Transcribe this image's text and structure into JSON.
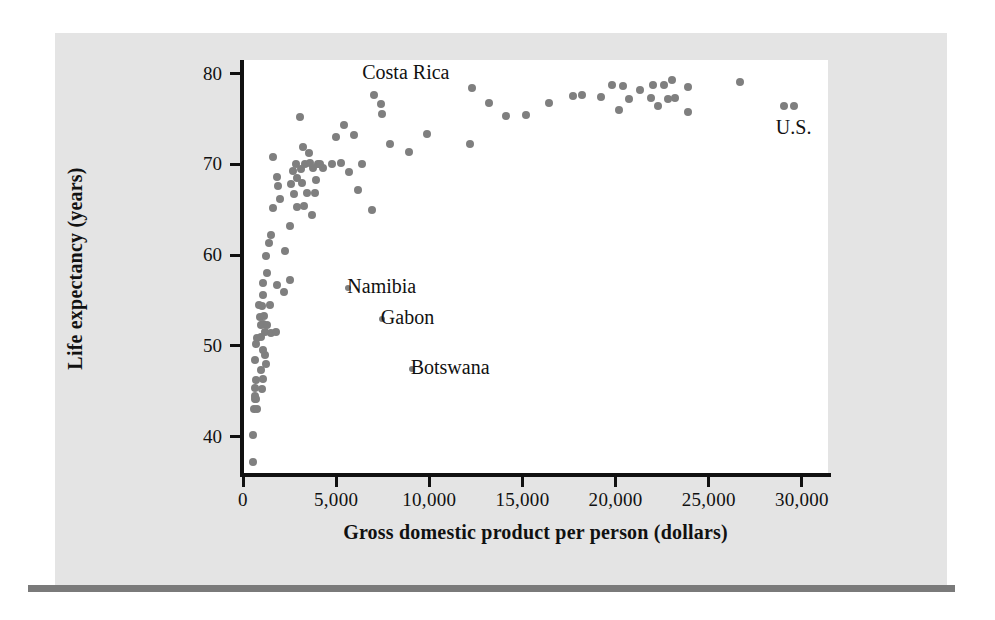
{
  "figure": {
    "background_color": "#e4e4e4",
    "plot_background_color": "#ffffff",
    "rule_color": "#7a7a7a",
    "point_color": "#7f7f7f",
    "axis_color": "#111111"
  },
  "chart_data": {
    "type": "scatter",
    "title": "",
    "xlabel": "Gross domestic product per person (dollars)",
    "ylabel": "Life expectancy (years)",
    "xlim": [
      0,
      31400
    ],
    "ylim": [
      36,
      81.5
    ],
    "xticks": [
      0,
      5000,
      10000,
      15000,
      20000,
      25000,
      30000
    ],
    "xticklabels": [
      "0",
      "5,000",
      "10,000",
      "15,000",
      "20,000",
      "25,000",
      "30,000"
    ],
    "yticks": [
      40,
      50,
      60,
      70,
      80
    ],
    "yticklabels": [
      "40",
      "50",
      "60",
      "70",
      "80"
    ],
    "grid": false,
    "legend": false,
    "annotations": [
      {
        "label": "Costa Rica",
        "x": 6400,
        "y": 80.0,
        "point_x": 7050,
        "point_y": 77.6,
        "align": "left"
      },
      {
        "label": "Namibia",
        "x": 5600,
        "y": 56.4,
        "point_x": 5650,
        "point_y": 56.4,
        "align": "left"
      },
      {
        "label": "Gabon",
        "x": 7400,
        "y": 53.0,
        "point_x": 7450,
        "point_y": 53.0,
        "align": "left"
      },
      {
        "label": "Botswana",
        "x": 9000,
        "y": 47.5,
        "point_x": 9050,
        "point_y": 47.5,
        "align": "left"
      },
      {
        "label": "U.S.",
        "x": 28600,
        "y": 73.9,
        "point_x": 29050,
        "point_y": 76.4,
        "align": "left"
      }
    ],
    "points": [
      [
        520,
        37.2
      ],
      [
        560,
        40.2
      ],
      [
        600,
        43.0
      ],
      [
        760,
        43.0
      ],
      [
        620,
        44.2
      ],
      [
        700,
        44.2
      ],
      [
        660,
        44.5
      ],
      [
        640,
        45.4
      ],
      [
        1000,
        45.3
      ],
      [
        690,
        46.2
      ],
      [
        1050,
        46.4
      ],
      [
        960,
        47.3
      ],
      [
        620,
        48.4
      ],
      [
        1250,
        48.0
      ],
      [
        1180,
        49.0
      ],
      [
        1050,
        49.6
      ],
      [
        700,
        50.2
      ],
      [
        730,
        50.9
      ],
      [
        950,
        51.0
      ],
      [
        1200,
        51.5
      ],
      [
        1500,
        51.4
      ],
      [
        1750,
        51.5
      ],
      [
        990,
        52.3
      ],
      [
        1100,
        52.4
      ],
      [
        1280,
        52.3
      ],
      [
        920,
        53.2
      ],
      [
        1120,
        53.3
      ],
      [
        880,
        54.5
      ],
      [
        1020,
        54.4
      ],
      [
        1450,
        54.5
      ],
      [
        1100,
        55.6
      ],
      [
        2200,
        55.9
      ],
      [
        1050,
        56.9
      ],
      [
        1800,
        56.7
      ],
      [
        2500,
        57.3
      ],
      [
        1300,
        58.0
      ],
      [
        1250,
        59.9
      ],
      [
        2250,
        60.5
      ],
      [
        1400,
        61.3
      ],
      [
        1500,
        62.2
      ],
      [
        2500,
        63.2
      ],
      [
        3700,
        64.4
      ],
      [
        1600,
        65.2
      ],
      [
        2900,
        65.3
      ],
      [
        3250,
        65.4
      ],
      [
        6900,
        65.0
      ],
      [
        2000,
        66.2
      ],
      [
        2750,
        66.7
      ],
      [
        3450,
        66.8
      ],
      [
        3850,
        66.8
      ],
      [
        6150,
        67.2
      ],
      [
        1900,
        67.6
      ],
      [
        2600,
        67.8
      ],
      [
        3150,
        68.0
      ],
      [
        2900,
        68.5
      ],
      [
        3900,
        68.3
      ],
      [
        1850,
        68.6
      ],
      [
        5700,
        69.2
      ],
      [
        2700,
        69.3
      ],
      [
        3100,
        69.5
      ],
      [
        3750,
        69.6
      ],
      [
        4300,
        69.6
      ],
      [
        2850,
        70.0
      ],
      [
        3350,
        70.0
      ],
      [
        3600,
        70.1
      ],
      [
        4000,
        70.0
      ],
      [
        4150,
        70.0
      ],
      [
        4800,
        70.0
      ],
      [
        6400,
        70.0
      ],
      [
        5250,
        70.2
      ],
      [
        1600,
        70.8
      ],
      [
        3550,
        71.3
      ],
      [
        3200,
        71.9
      ],
      [
        8900,
        71.4
      ],
      [
        7900,
        72.2
      ],
      [
        12200,
        72.3
      ],
      [
        5000,
        73.0
      ],
      [
        5950,
        73.2
      ],
      [
        9900,
        73.3
      ],
      [
        5400,
        74.3
      ],
      [
        3050,
        75.2
      ],
      [
        14100,
        75.3
      ],
      [
        15200,
        75.4
      ],
      [
        7450,
        75.5
      ],
      [
        7400,
        76.6
      ],
      [
        13200,
        76.8
      ],
      [
        20200,
        76.0
      ],
      [
        22300,
        76.4
      ],
      [
        29050,
        76.4
      ],
      [
        29550,
        76.4
      ],
      [
        16400,
        76.8
      ],
      [
        19200,
        77.4
      ],
      [
        23900,
        75.8
      ],
      [
        20700,
        77.2
      ],
      [
        21900,
        77.3
      ],
      [
        22800,
        77.2
      ],
      [
        23200,
        77.3
      ],
      [
        17700,
        77.5
      ],
      [
        18200,
        77.6
      ],
      [
        7050,
        77.6
      ],
      [
        21300,
        78.2
      ],
      [
        12300,
        78.4
      ],
      [
        19800,
        78.7
      ],
      [
        20400,
        78.6
      ],
      [
        22000,
        78.8
      ],
      [
        23000,
        79.3
      ],
      [
        23900,
        78.5
      ],
      [
        26700,
        79.1
      ],
      [
        22600,
        78.7
      ]
    ]
  }
}
